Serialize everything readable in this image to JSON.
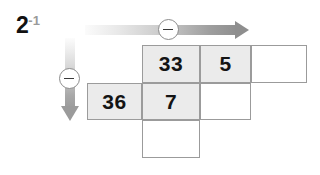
{
  "canvas": {
    "width": 320,
    "height": 175,
    "background": "#ffffff"
  },
  "corner_label": {
    "base": "2",
    "exponent": "-1",
    "base_color": "#111111",
    "exponent_color": "#9a9a9a"
  },
  "arrows": {
    "horizontal": {
      "name": "horizontal-arrow",
      "direction": "right",
      "gradient_from": "#fbfbfb",
      "gradient_to": "#8e8e8e",
      "badge": {
        "icon": "minus-circle-icon",
        "symbol": "−",
        "label": "minus"
      }
    },
    "vertical": {
      "name": "vertical-arrow",
      "direction": "down",
      "gradient_from": "#fcfcfc",
      "gradient_to": "#9b9b9b",
      "badge": {
        "icon": "minus-circle-icon",
        "symbol": "−",
        "label": "minus"
      }
    }
  },
  "grid": {
    "border_color": "#9b9b9b",
    "shaded_color": "#ebebeb",
    "empty_color": "#ffffff",
    "rows": [
      {
        "row": 1,
        "cells": [
          {
            "col": 1,
            "value": "",
            "shaded": false,
            "present": false
          },
          {
            "col": 2,
            "value": "33",
            "shaded": true,
            "present": true
          },
          {
            "col": 3,
            "value": "5",
            "shaded": true,
            "present": true
          },
          {
            "col": 4,
            "value": "",
            "shaded": false,
            "present": true
          }
        ]
      },
      {
        "row": 2,
        "cells": [
          {
            "col": 1,
            "value": "36",
            "shaded": true,
            "present": true
          },
          {
            "col": 2,
            "value": "7",
            "shaded": true,
            "present": true
          },
          {
            "col": 3,
            "value": "",
            "shaded": false,
            "present": true
          },
          {
            "col": 4,
            "value": "",
            "shaded": false,
            "present": false
          }
        ]
      },
      {
        "row": 3,
        "cells": [
          {
            "col": 1,
            "value": "",
            "shaded": false,
            "present": false
          },
          {
            "col": 2,
            "value": "",
            "shaded": false,
            "present": true
          },
          {
            "col": 3,
            "value": "",
            "shaded": false,
            "present": false
          },
          {
            "col": 4,
            "value": "",
            "shaded": false,
            "present": false
          }
        ]
      }
    ]
  }
}
